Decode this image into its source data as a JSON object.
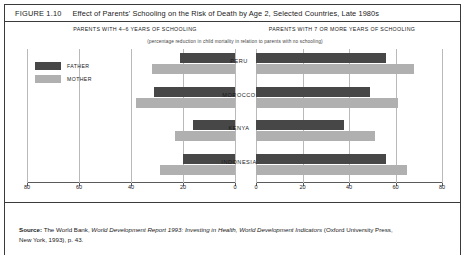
{
  "figure": {
    "number": "FIGURE 1.10",
    "title": "Effect of Parents' Schooling on the Risk of Death by Age 2, Selected Countries, Late 1980s"
  },
  "panels": {
    "left_heading": "PARENTS WITH 4–6 YEARS OF SCHOOLING",
    "right_heading": "PARENTS WITH 7 OR MORE YEARS OF SCHOOLING",
    "subtitle": "(percentage reduction in child mortality in relation to parents with no schooling)"
  },
  "legend": {
    "father_label": "FATHER",
    "mother_label": "MOTHER",
    "father_color": "#474747",
    "mother_color": "#b0b0b0"
  },
  "axis": {
    "left_ticks": [
      "80",
      "60",
      "40",
      "20",
      "0"
    ],
    "right_ticks": [
      "0",
      "20",
      "40",
      "60",
      "80"
    ]
  },
  "countries": [
    "PERU",
    "MOROCCO",
    "KENYA",
    "INDONESIA"
  ],
  "source": {
    "label": "Source:",
    "line1_a": " The World Bank, ",
    "line1_b": "World Development Report 1993:  Investing in Health, World Development Indicators",
    "line1_c": "  (Oxford University Press,",
    "line2": "New York, 1993), p. 43."
  },
  "chart_data": {
    "type": "bar",
    "title": "Effect of Parents' Schooling on the Risk of Death by Age 2, Selected Countries, Late 1980s",
    "subtitle": "(percentage reduction in child mortality in relation to parents with no schooling)",
    "orientation": "horizontal",
    "categories": [
      "PERU",
      "MOROCCO",
      "KENYA",
      "INDONESIA"
    ],
    "xlabel": "",
    "ylabel": "",
    "grid": true,
    "legend_position": "upper-left",
    "panels": [
      {
        "name": "PARENTS WITH 4–6 YEARS OF SCHOOLING",
        "direction": "right-to-left",
        "xlim": [
          80,
          0
        ],
        "ticks": [
          80,
          60,
          40,
          20,
          0
        ],
        "series": [
          {
            "name": "FATHER",
            "color": "#474747",
            "values": [
              21,
              31,
              16,
              20
            ]
          },
          {
            "name": "MOTHER",
            "color": "#b0b0b0",
            "values": [
              32,
              38,
              23,
              29
            ]
          }
        ]
      },
      {
        "name": "PARENTS WITH 7 OR MORE YEARS OF SCHOOLING",
        "direction": "left-to-right",
        "xlim": [
          0,
          80
        ],
        "ticks": [
          0,
          20,
          40,
          60,
          80
        ],
        "series": [
          {
            "name": "FATHER",
            "color": "#474747",
            "values": [
              56,
              49,
              38,
              56
            ]
          },
          {
            "name": "MOTHER",
            "color": "#b0b0b0",
            "values": [
              68,
              61,
              51,
              65
            ]
          }
        ]
      }
    ]
  }
}
